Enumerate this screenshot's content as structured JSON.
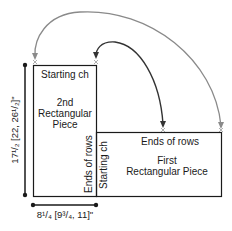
{
  "diagram": {
    "second_piece": {
      "top_label": "Starting ch",
      "title_lines": [
        "2nd",
        "Rectangular",
        "Piece"
      ],
      "side_label": "Ends of rows"
    },
    "first_piece": {
      "top_label": "Ends of rows",
      "title_lines": [
        "First",
        "Rectangular Piece"
      ],
      "side_label": "Starting ch"
    },
    "height_dimension": "17¹/₂ [22, 26¹/₂]\"",
    "width_dimension": "8¹/₄ [9³/₄, 11]\"",
    "markers": [
      "x",
      "x",
      "x",
      "x"
    ],
    "colors": {
      "outline": "#1a1a1a",
      "arrow_dark": "#333333",
      "arrow_gray": "#8a8a8a",
      "marker": "#9a9a9a"
    }
  }
}
